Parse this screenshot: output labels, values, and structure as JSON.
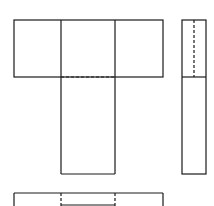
{
  "diagram": {
    "type": "orthographic-projection-three-views",
    "stroke_color": "#1a1a1a",
    "background": "#ffffff",
    "views": [
      {
        "name": "front-view",
        "shape": "T-shape",
        "hidden_lines": "horizontal dashed line at junction of crossbar and stem"
      },
      {
        "name": "side-view",
        "shape": "tall narrow rectangle",
        "hidden_lines": "vertical dashed line in upper portion"
      },
      {
        "name": "top-view",
        "shape": "wide rectangle (partially cropped)",
        "hidden_lines": "two vertical dashed lines"
      }
    ]
  }
}
